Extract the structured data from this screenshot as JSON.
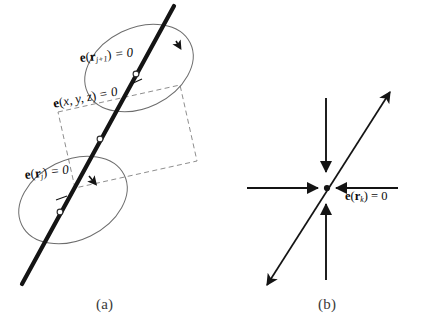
{
  "figure": {
    "background_color": "#ffffff",
    "ink_color": "#111111",
    "thin_line_color": "#5a5a5a",
    "dashed_color": "#8a8a8a"
  },
  "panel_a": {
    "caption": "(a)",
    "labels": {
      "upper_ellipse": {
        "function": "e",
        "open_paren": "(",
        "variable": "r",
        "subscript": "j+1",
        "close_paren": ")",
        "equals": "= 0",
        "full_text": "e(r_j+1) = 0"
      },
      "dashed_box": {
        "function": "e",
        "open_paren": "(",
        "variable": "x, y, z",
        "close_paren": ")",
        "equals": "= 0",
        "full_text": "e(x, y, z) = 0"
      },
      "lower_ellipse": {
        "function": "e",
        "open_paren": "(",
        "variable": "r",
        "subscript": "j",
        "close_paren": ")",
        "equals": "= 0",
        "full_text": "e(r_j) = 0"
      }
    },
    "shapes": {
      "thick_line": "diagonal trajectory line",
      "upper_ellipse": "tilted ellipse with clockwise direction arrowhead",
      "lower_ellipse": "tilted ellipse with clockwise direction arrowhead",
      "dashed_rectangle": "tilted dashed bounding rectangle",
      "node_markers": 3
    }
  },
  "panel_b": {
    "caption": "(b)",
    "label": {
      "function": "e",
      "open_paren": "(",
      "variable": "r",
      "subscript": "k",
      "close_paren": ")",
      "equals": "= 0",
      "full_text": "e(r_k) = 0"
    },
    "shapes": {
      "horizontal_axis": "horizontal line with two inward arrowheads",
      "vertical_axis": "vertical line with two inward arrowheads",
      "diagonal_arrow": "double-headed diagonal arrow through origin",
      "convergence_point": "center intersection point"
    }
  }
}
